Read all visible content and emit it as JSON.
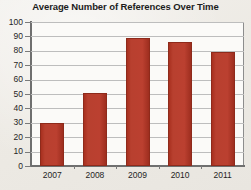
{
  "chart_data": {
    "type": "bar",
    "title": "Average Number of References Over Time",
    "xlabel": "",
    "ylabel": "",
    "categories": [
      "2007",
      "2008",
      "2009",
      "2010",
      "2011"
    ],
    "values": [
      30,
      51,
      89,
      86,
      79
    ],
    "ylim": [
      0,
      100
    ],
    "ytick_step": 10,
    "yticks": [
      "0",
      "10",
      "20",
      "30",
      "40",
      "50",
      "60",
      "70",
      "80",
      "90",
      "100"
    ],
    "grid": true,
    "legend": false,
    "bar_color": "#b8402f",
    "background_color": "#efeeea",
    "plot_background_color": "#fbfaf8",
    "axis_color": "#6f6f6f",
    "gridline_color": "#bdbdbd"
  }
}
